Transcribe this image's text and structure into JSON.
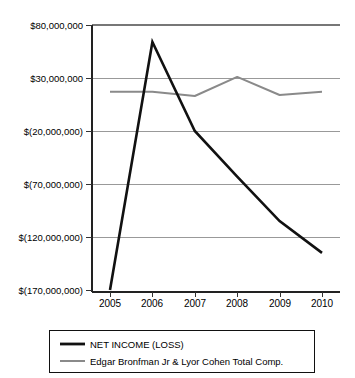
{
  "chart_data": {
    "type": "line",
    "title": "",
    "subtitle": "",
    "xlabel": "",
    "ylabel": "",
    "categories": [
      "2005",
      "2006",
      "2007",
      "2008",
      "2009",
      "2010"
    ],
    "x": [
      2005,
      2006,
      2007,
      2008,
      2009,
      2010
    ],
    "ylim": [
      -170000000,
      80000000
    ],
    "ytick_values": [
      80000000,
      30000000,
      -20000000,
      -70000000,
      -120000000,
      -170000000
    ],
    "ytick_labels": [
      "$80,000,000",
      "$30,000,000",
      "$(20,000,000)",
      "$(70,000,000)",
      "$(120,000,000)",
      "$(170,000,000)"
    ],
    "grid": true,
    "grid_axis": "y",
    "legend_position": "bottom",
    "series": [
      {
        "name": "NET INCOME (LOSS)",
        "color": "#111111",
        "values": [
          -170000000,
          64000000,
          -20000000,
          -63000000,
          -105000000,
          -135000000
        ]
      },
      {
        "name": "Edgar Bronfman Jr & Lyor Cohen Total Comp.",
        "color": "#8a8a8a",
        "values": [
          17000000,
          17000000,
          13000000,
          31000000,
          14000000,
          17000000
        ]
      }
    ]
  },
  "legend": {
    "entries": [
      {
        "label": "NET INCOME (LOSS)",
        "color": "#111111"
      },
      {
        "label": "Edgar Bronfman Jr & Lyor Cohen Total Comp.",
        "color": "#8a8a8a"
      }
    ]
  }
}
